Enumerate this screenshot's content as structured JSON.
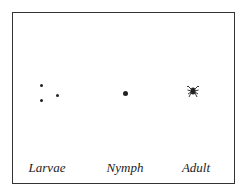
{
  "diagram": {
    "title": "",
    "stages": [
      {
        "label": "Larvae",
        "icon": "larva-dots-icon"
      },
      {
        "label": "Nymph",
        "icon": "nymph-dot-icon"
      },
      {
        "label": "Adult",
        "icon": "adult-tick-icon"
      }
    ]
  }
}
